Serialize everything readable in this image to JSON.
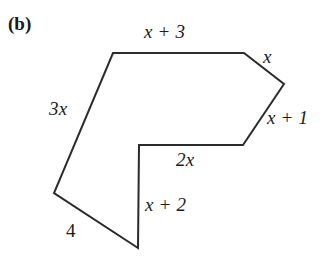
{
  "figure": {
    "part_label": "(b)",
    "shape_name": "irregular-heptagon",
    "stroke_color": "#2b2b2b",
    "fill_color": "#ffffff",
    "background_color": "#ffffff",
    "stroke_width": 2,
    "vertices": [
      [
        113,
        53
      ],
      [
        244,
        53
      ],
      [
        284,
        84
      ],
      [
        243,
        145
      ],
      [
        139,
        145
      ],
      [
        138,
        248
      ],
      [
        54,
        193
      ]
    ],
    "side_labels": [
      {
        "id": "top",
        "text": "x + 3",
        "x": 144,
        "y": 22,
        "italic": true
      },
      {
        "id": "upper-right",
        "text": "x",
        "x": 263,
        "y": 47,
        "italic": true
      },
      {
        "id": "lower-right",
        "text": "x + 1",
        "x": 267,
        "y": 108,
        "italic": true
      },
      {
        "id": "inner-horizontal",
        "text": "2x",
        "x": 176,
        "y": 150,
        "italic": true
      },
      {
        "id": "inner-vertical",
        "text": "x + 2",
        "x": 145,
        "y": 195,
        "italic": true
      },
      {
        "id": "bottom-left",
        "text": "4",
        "x": 66,
        "y": 221,
        "italic": false
      },
      {
        "id": "left",
        "text": "3x",
        "x": 49,
        "y": 99,
        "italic": true
      }
    ]
  },
  "chart_data": {
    "type": "diagram",
    "title": "(b)",
    "sides": [
      {
        "from": [
          113,
          53
        ],
        "to": [
          244,
          53
        ],
        "label": "x + 3"
      },
      {
        "from": [
          244,
          53
        ],
        "to": [
          284,
          84
        ],
        "label": "x"
      },
      {
        "from": [
          284,
          84
        ],
        "to": [
          243,
          145
        ],
        "label": "x + 1"
      },
      {
        "from": [
          243,
          145
        ],
        "to": [
          139,
          145
        ],
        "label": "2x"
      },
      {
        "from": [
          139,
          145
        ],
        "to": [
          138,
          248
        ],
        "label": "x + 2"
      },
      {
        "from": [
          138,
          248
        ],
        "to": [
          54,
          193
        ],
        "label": "4"
      },
      {
        "from": [
          54,
          193
        ],
        "to": [
          113,
          53
        ],
        "label": "3x"
      }
    ],
    "side_count": 7,
    "labels": [
      "x + 3",
      "x",
      "x + 1",
      "2x",
      "x + 2",
      "4",
      "3x"
    ]
  }
}
